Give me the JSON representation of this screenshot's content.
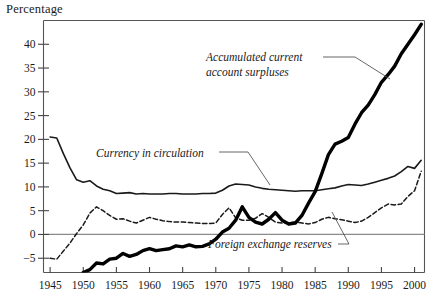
{
  "figure": {
    "unit_label": "Percentage",
    "background": "#ffffff",
    "ink_color": "#1a1a1a",
    "zero_line_color": "#8a8a8a"
  },
  "annotations": [
    {
      "id": "accumulated",
      "line1": "Accumulated current",
      "line2": "account surpluses"
    },
    {
      "id": "currency",
      "line1": "Currency in circulation",
      "line2": ""
    },
    {
      "id": "reserves",
      "line1": "Foreign exchange reserves",
      "line2": ""
    }
  ],
  "chart_data": {
    "type": "line",
    "title": "",
    "subtitle": "",
    "xlabel": "",
    "ylabel": "Percentage",
    "xlim": [
      1944,
      2001.5
    ],
    "ylim": [
      -8,
      45
    ],
    "grid": false,
    "legend": "annotations-inline",
    "xticks": [
      1945,
      1950,
      1955,
      1960,
      1965,
      1970,
      1975,
      1980,
      1985,
      1990,
      1995,
      2000
    ],
    "xtick_labels": [
      "1945",
      "1950",
      "1955",
      "1960",
      "1965",
      "1970",
      "1975",
      "1980",
      "1985",
      "1990",
      "1995",
      "2000"
    ],
    "yticks": [
      -5,
      0,
      5,
      10,
      15,
      20,
      25,
      30,
      35,
      40
    ],
    "ytick_labels": [
      "−5",
      "0",
      "5",
      "10",
      "15",
      "20",
      "25",
      "30",
      "35",
      "40"
    ],
    "zero_line": 0,
    "series": [
      {
        "name": "Currency in circulation",
        "style": "solid-thin",
        "color": "#1a1a1a",
        "width": 1.6,
        "x": [
          1945,
          1946,
          1947,
          1948,
          1949,
          1950,
          1951,
          1952,
          1953,
          1954,
          1955,
          1956,
          1957,
          1958,
          1959,
          1960,
          1961,
          1962,
          1963,
          1964,
          1965,
          1966,
          1967,
          1968,
          1969,
          1970,
          1971,
          1972,
          1973,
          1974,
          1975,
          1976,
          1977,
          1978,
          1979,
          1980,
          1981,
          1982,
          1983,
          1984,
          1985,
          1986,
          1987,
          1988,
          1989,
          1990,
          1991,
          1992,
          1993,
          1994,
          1995,
          1996,
          1997,
          1998,
          1999,
          2000,
          2001
        ],
        "values": [
          20.5,
          20.3,
          17.0,
          14.0,
          11.5,
          11.0,
          11.3,
          10.2,
          9.5,
          9.2,
          8.6,
          8.7,
          8.8,
          8.5,
          8.6,
          8.5,
          8.5,
          8.5,
          8.6,
          8.6,
          8.5,
          8.5,
          8.5,
          8.6,
          8.6,
          8.7,
          9.3,
          10.2,
          10.6,
          10.5,
          10.4,
          10.0,
          9.7,
          9.5,
          9.4,
          9.3,
          9.2,
          9.1,
          9.2,
          9.2,
          9.2,
          9.4,
          9.6,
          9.8,
          10.2,
          10.5,
          10.4,
          10.3,
          10.6,
          11.0,
          11.4,
          11.8,
          12.3,
          13.2,
          14.3,
          13.9,
          15.6
        ]
      },
      {
        "name": "Foreign exchange reserves",
        "style": "dashed",
        "color": "#1a1a1a",
        "width": 1.5,
        "x": [
          1945,
          1946,
          1947,
          1948,
          1949,
          1950,
          1951,
          1952,
          1953,
          1954,
          1955,
          1956,
          1957,
          1958,
          1959,
          1960,
          1961,
          1962,
          1963,
          1964,
          1965,
          1966,
          1967,
          1968,
          1969,
          1970,
          1971,
          1972,
          1973,
          1974,
          1975,
          1976,
          1977,
          1978,
          1979,
          1980,
          1981,
          1982,
          1983,
          1984,
          1985,
          1986,
          1987,
          1988,
          1989,
          1990,
          1991,
          1992,
          1993,
          1994,
          1995,
          1996,
          1997,
          1998,
          1999,
          2000,
          2001
        ],
        "values": [
          -5.0,
          -5.2,
          -3.5,
          -1.8,
          0.2,
          2.0,
          4.5,
          5.8,
          5.0,
          4.0,
          3.2,
          3.3,
          2.8,
          2.4,
          3.0,
          3.6,
          3.2,
          2.9,
          2.7,
          2.6,
          2.6,
          2.5,
          2.4,
          2.3,
          2.3,
          2.4,
          4.2,
          5.6,
          3.5,
          3.0,
          3.0,
          3.4,
          4.4,
          3.6,
          2.6,
          2.4,
          2.4,
          2.6,
          2.4,
          2.2,
          2.5,
          3.2,
          3.6,
          3.3,
          3.1,
          2.8,
          2.5,
          2.8,
          3.6,
          4.6,
          5.6,
          6.4,
          6.2,
          6.4,
          8.0,
          9.2,
          13.3
        ]
      },
      {
        "name": "Accumulated current account surpluses",
        "style": "solid-thick",
        "color": "#000000",
        "width": 3.4,
        "x": [
          1950,
          1951,
          1952,
          1953,
          1954,
          1955,
          1956,
          1957,
          1958,
          1959,
          1960,
          1961,
          1962,
          1963,
          1964,
          1965,
          1966,
          1967,
          1968,
          1969,
          1970,
          1971,
          1972,
          1973,
          1974,
          1975,
          1976,
          1977,
          1978,
          1979,
          1980,
          1981,
          1982,
          1983,
          1984,
          1985,
          1986,
          1987,
          1988,
          1989,
          1990,
          1991,
          1992,
          1993,
          1994,
          1995,
          1996,
          1997,
          1998,
          1999,
          2000,
          2001
        ],
        "values": [
          -8.5,
          -7.4,
          -6.0,
          -6.2,
          -5.2,
          -5.0,
          -4.0,
          -4.6,
          -4.2,
          -3.4,
          -3.0,
          -3.4,
          -3.2,
          -3.0,
          -2.4,
          -2.6,
          -2.2,
          -2.6,
          -2.5,
          -2.0,
          -1.0,
          0.5,
          1.3,
          3.0,
          5.8,
          3.6,
          2.6,
          2.2,
          3.2,
          4.6,
          3.0,
          2.2,
          2.4,
          4.0,
          6.6,
          9.0,
          12.8,
          16.8,
          19.0,
          19.6,
          20.4,
          23.2,
          25.6,
          27.2,
          29.4,
          32.0,
          33.6,
          35.4,
          38.0,
          40.0,
          42.0,
          44.2
        ]
      }
    ]
  }
}
